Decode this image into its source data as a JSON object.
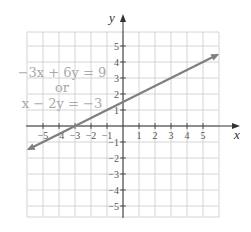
{
  "chart_data": {
    "type": "line",
    "title": "",
    "xlabel": "x",
    "ylabel": "y",
    "xlim": [
      -6,
      6
    ],
    "ylim": [
      -5.7,
      5.9
    ],
    "grid": true,
    "x_ticks": [
      -5,
      -4,
      -3,
      -2,
      -1,
      1,
      2,
      3,
      4,
      5
    ],
    "y_ticks": [
      5,
      4,
      3,
      2,
      1,
      -1,
      -2,
      -3,
      -4,
      -5
    ],
    "x_tick_labels": [
      "−5",
      "−4",
      "−3",
      "−2",
      "−1",
      "1",
      "2",
      "3",
      "4",
      "5"
    ],
    "y_tick_labels": [
      "5",
      "4",
      "3",
      "2",
      "1",
      "−1",
      "−2",
      "−3",
      "−4",
      "−5"
    ],
    "series": [
      {
        "name": "−3x + 6y = 9 or x − 2y = −3",
        "equation": "y = 0.5x + 1.5",
        "x": [
          -5.9,
          5.9
        ],
        "values": [
          -1.45,
          4.45
        ],
        "arrows": "both",
        "color": "#808080"
      }
    ],
    "annotations": [
      {
        "text": "−3x + 6y = 9",
        "line": 1
      },
      {
        "text": "or",
        "line": 2
      },
      {
        "text": "x − 2y = −3",
        "line": 3
      }
    ]
  },
  "labels": {
    "x_axis": "x",
    "y_axis": "y",
    "eq_line1": "−3x + 6y = 9",
    "eq_line2": "or",
    "eq_line3": "x − 2y = −3"
  },
  "colors": {
    "grid": "#cfcfcf",
    "axis": "#333333",
    "line": "#7f7f7f",
    "equation_text": "#a9a9a9"
  }
}
